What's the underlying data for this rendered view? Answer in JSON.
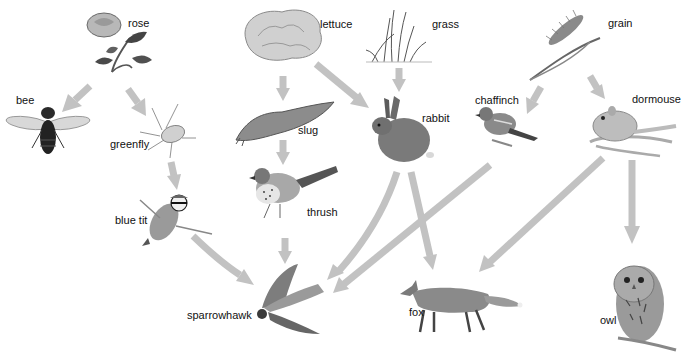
{
  "diagram": {
    "type": "food-web",
    "arrow_color": "#c2c2c2",
    "organisms": [
      {
        "id": "rose",
        "label": "rose",
        "kind": "producer"
      },
      {
        "id": "lettuce",
        "label": "lettuce",
        "kind": "producer"
      },
      {
        "id": "grass",
        "label": "grass",
        "kind": "producer"
      },
      {
        "id": "grain",
        "label": "grain",
        "kind": "producer"
      },
      {
        "id": "bee",
        "label": "bee",
        "kind": "consumer"
      },
      {
        "id": "greenfly",
        "label": "greenfly",
        "kind": "consumer"
      },
      {
        "id": "slug",
        "label": "slug",
        "kind": "consumer"
      },
      {
        "id": "rabbit",
        "label": "rabbit",
        "kind": "consumer"
      },
      {
        "id": "chaffinch",
        "label": "chaffinch",
        "kind": "consumer"
      },
      {
        "id": "dormouse",
        "label": "dormouse",
        "kind": "consumer"
      },
      {
        "id": "blue_tit",
        "label": "blue tit",
        "kind": "consumer"
      },
      {
        "id": "thrush",
        "label": "thrush",
        "kind": "consumer"
      },
      {
        "id": "sparrowhawk",
        "label": "sparrowhawk",
        "kind": "consumer"
      },
      {
        "id": "fox",
        "label": "fox",
        "kind": "consumer"
      },
      {
        "id": "owl",
        "label": "owl",
        "kind": "consumer"
      }
    ],
    "edges": [
      {
        "from": "rose",
        "to": "bee"
      },
      {
        "from": "rose",
        "to": "greenfly"
      },
      {
        "from": "greenfly",
        "to": "blue_tit"
      },
      {
        "from": "blue_tit",
        "to": "sparrowhawk"
      },
      {
        "from": "lettuce",
        "to": "slug"
      },
      {
        "from": "lettuce",
        "to": "rabbit"
      },
      {
        "from": "grass",
        "to": "rabbit"
      },
      {
        "from": "slug",
        "to": "thrush"
      },
      {
        "from": "thrush",
        "to": "sparrowhawk"
      },
      {
        "from": "rabbit",
        "to": "sparrowhawk"
      },
      {
        "from": "rabbit",
        "to": "fox"
      },
      {
        "from": "grain",
        "to": "chaffinch"
      },
      {
        "from": "grain",
        "to": "dormouse"
      },
      {
        "from": "chaffinch",
        "to": "sparrowhawk"
      },
      {
        "from": "dormouse",
        "to": "fox"
      },
      {
        "from": "dormouse",
        "to": "owl"
      }
    ]
  },
  "labels": {
    "rose": "rose",
    "lettuce": "lettuce",
    "grass": "grass",
    "grain": "grain",
    "bee": "bee",
    "greenfly": "greenfly",
    "slug": "slug",
    "rabbit": "rabbit",
    "chaffinch": "chaffinch",
    "dormouse": "dormouse",
    "blue_tit": "blue tit",
    "thrush": "thrush",
    "sparrowhawk": "sparrowhawk",
    "fox": "fox",
    "owl": "owl"
  }
}
